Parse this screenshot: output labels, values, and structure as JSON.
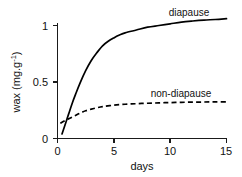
{
  "chart_data": {
    "type": "line",
    "title": "",
    "subtitle": "",
    "xlabel": "days",
    "ylabel": "wax (mg.g⁻¹)",
    "ylabel_base": "wax (mg.g",
    "ylabel_sup": "-1",
    "ylabel_close": ")",
    "xlim": [
      0,
      15
    ],
    "ylim": [
      0,
      1.13
    ],
    "grid": false,
    "legend_position": "inline-right",
    "x_ticks": [
      0,
      5,
      10,
      15
    ],
    "x_tick_labels": [
      "0",
      "5",
      "10",
      "15"
    ],
    "y_ticks": [
      0,
      0.5,
      1
    ],
    "y_tick_labels": [
      "0",
      "0.5",
      "1"
    ],
    "annotations": [
      {
        "text": "diapause",
        "x": 11.6,
        "y": 1.12
      },
      {
        "text": "non-diapause",
        "x": 10.4,
        "y": 0.43
      }
    ],
    "series": [
      {
        "name": "diapause",
        "style": "solid",
        "label": "diapause",
        "x": [
          0.4,
          0.6,
          0.8,
          1.0,
          1.3,
          1.6,
          2.0,
          2.5,
          3.0,
          3.5,
          4.0,
          4.5,
          5.0,
          5.5,
          6.0,
          7.0,
          8.0,
          9.0,
          10.0,
          11.0,
          12.0,
          13.0,
          14.0,
          15.0
        ],
        "y": [
          0.04,
          0.1,
          0.16,
          0.22,
          0.31,
          0.39,
          0.49,
          0.6,
          0.69,
          0.76,
          0.82,
          0.86,
          0.89,
          0.915,
          0.935,
          0.96,
          0.985,
          1.0,
          1.015,
          1.03,
          1.04,
          1.048,
          1.053,
          1.06
        ]
      },
      {
        "name": "non-diapause",
        "style": "dashed",
        "label": "non-diapause",
        "x": [
          0.25,
          0.6,
          1.0,
          1.5,
          2.0,
          2.5,
          3.0,
          3.5,
          4.0,
          5.0,
          6.0,
          7.0,
          8.0,
          9.0,
          10.0,
          11.0,
          12.0,
          13.0,
          14.0,
          15.0
        ],
        "y": [
          0.135,
          0.155,
          0.175,
          0.2,
          0.225,
          0.245,
          0.26,
          0.272,
          0.282,
          0.295,
          0.303,
          0.308,
          0.312,
          0.315,
          0.318,
          0.32,
          0.322,
          0.323,
          0.324,
          0.325
        ]
      }
    ],
    "colors": {
      "axis": "#1a1a1a",
      "series_diapause": "#000000",
      "series_non_diapause": "#000000",
      "background": "#ffffff"
    }
  }
}
